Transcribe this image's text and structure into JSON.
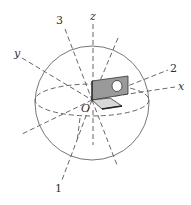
{
  "diagram": {
    "type": "3d-coordinate-sphere-with-bracket",
    "origin_label": "O",
    "axes": {
      "z": "z",
      "y": "y",
      "x": "x",
      "axis_1": "1",
      "axis_2": "2",
      "axis_3": "3"
    },
    "colors": {
      "line": "#555555",
      "plate_fill": "#9a9a9a",
      "plate_edge": "#333333",
      "base_fill": "#d8d8d8"
    }
  }
}
